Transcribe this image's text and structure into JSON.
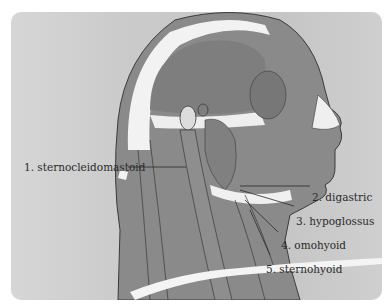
{
  "diagram": {
    "labels": [
      {
        "number": "1.",
        "text": "sternocleidomastoid",
        "full": "1. sternocleidomastoid"
      },
      {
        "number": "2.",
        "text": "digastric",
        "full": "2. digastric"
      },
      {
        "number": "3.",
        "text": "hypoglossus",
        "full": "3. hypoglossus"
      },
      {
        "number": "4.",
        "text": "omohyoid",
        "full": "4. omohyoid"
      },
      {
        "number": "5.",
        "text": "sternohyoid",
        "full": "5. sternohyoid"
      }
    ],
    "colors": {
      "background": "#cbcbcb",
      "muscle": "#8c8c8c",
      "muscle_dark": "#7a7a7a",
      "bone": "#f2f2f2",
      "outline": "#3a3a3a",
      "label_text": "#2a2a2a"
    }
  }
}
